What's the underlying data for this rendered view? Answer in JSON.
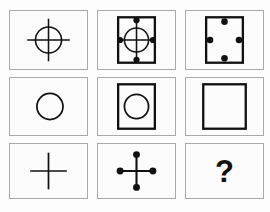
{
  "puzzle": {
    "type": "matrix-reasoning-3x3",
    "title": "",
    "rows": 3,
    "columns": 3,
    "stroke_color": "#111111",
    "cell_border_color": "#a9a9a9",
    "background_color": "#fdfdfd",
    "cells": [
      {
        "id": "cell-1",
        "position": "row1-col1",
        "description": "circle with cross overlay",
        "elements": [
          "circle",
          "cross"
        ],
        "has_square": false,
        "has_circle": true,
        "has_cross": true,
        "dot_count": 0,
        "label": ""
      },
      {
        "id": "cell-2",
        "position": "row1-col2",
        "description": "square containing circle with cross and four dots",
        "elements": [
          "square",
          "circle",
          "cross",
          "dots"
        ],
        "has_square": true,
        "has_circle": true,
        "has_cross": true,
        "dot_count": 4,
        "label": ""
      },
      {
        "id": "cell-3",
        "position": "row1-col3",
        "description": "square with four dots at edge midpoints",
        "elements": [
          "square",
          "dots"
        ],
        "has_square": true,
        "has_circle": false,
        "has_cross": false,
        "dot_count": 4,
        "label": ""
      },
      {
        "id": "cell-4",
        "position": "row2-col1",
        "description": "circle only",
        "elements": [
          "circle"
        ],
        "has_square": false,
        "has_circle": true,
        "has_cross": false,
        "dot_count": 0,
        "label": ""
      },
      {
        "id": "cell-5",
        "position": "row2-col2",
        "description": "square containing circle",
        "elements": [
          "square",
          "circle"
        ],
        "has_square": true,
        "has_circle": true,
        "has_cross": false,
        "dot_count": 0,
        "label": ""
      },
      {
        "id": "cell-6",
        "position": "row2-col3",
        "description": "empty square",
        "elements": [
          "square"
        ],
        "has_square": true,
        "has_circle": false,
        "has_cross": false,
        "dot_count": 0,
        "label": ""
      },
      {
        "id": "cell-7",
        "position": "row3-col1",
        "description": "cross only",
        "elements": [
          "cross"
        ],
        "has_square": false,
        "has_circle": false,
        "has_cross": true,
        "dot_count": 0,
        "label": ""
      },
      {
        "id": "cell-8",
        "position": "row3-col2",
        "description": "cross with four dots at its endpoints",
        "elements": [
          "cross",
          "dots"
        ],
        "has_square": false,
        "has_circle": false,
        "has_cross": true,
        "dot_count": 4,
        "label": ""
      },
      {
        "id": "cell-9",
        "position": "row3-col3",
        "description": "missing piece marked with a question mark",
        "elements": [
          "question-mark"
        ],
        "has_square": false,
        "has_circle": false,
        "has_cross": false,
        "dot_count": 0,
        "label": "?"
      }
    ]
  }
}
